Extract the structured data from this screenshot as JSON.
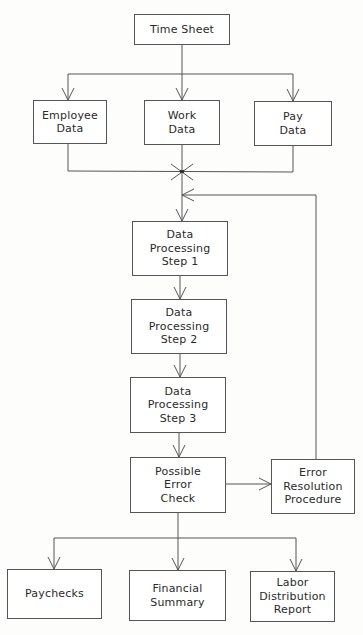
{
  "diagram": {
    "type": "flowchart",
    "nodes": [
      {
        "id": "time-sheet",
        "label": "Time Sheet"
      },
      {
        "id": "employee-data",
        "label": "Employee\nData"
      },
      {
        "id": "work-data",
        "label": "Work\nData"
      },
      {
        "id": "pay-data",
        "label": "Pay\nData"
      },
      {
        "id": "dp-step-1",
        "label": "Data\nProcessing\nStep 1"
      },
      {
        "id": "dp-step-2",
        "label": "Data\nProcessing\nStep 2"
      },
      {
        "id": "dp-step-3",
        "label": "Data\nProcessing\nStep 3"
      },
      {
        "id": "error-check",
        "label": "Possible\nError\nCheck"
      },
      {
        "id": "error-resolution",
        "label": "Error\nResolution\nProcedure"
      },
      {
        "id": "paychecks",
        "label": "Paychecks"
      },
      {
        "id": "financial-summary",
        "label": "Financial\nSummary"
      },
      {
        "id": "labor-report",
        "label": "Labor\nDistribution\nReport"
      }
    ],
    "edges": [
      {
        "from": "time-sheet",
        "to": "employee-data"
      },
      {
        "from": "time-sheet",
        "to": "work-data"
      },
      {
        "from": "time-sheet",
        "to": "pay-data"
      },
      {
        "from": "employee-data",
        "to": "dp-step-1"
      },
      {
        "from": "work-data",
        "to": "dp-step-1"
      },
      {
        "from": "pay-data",
        "to": "dp-step-1"
      },
      {
        "from": "dp-step-1",
        "to": "dp-step-2"
      },
      {
        "from": "dp-step-2",
        "to": "dp-step-3"
      },
      {
        "from": "dp-step-3",
        "to": "error-check"
      },
      {
        "from": "error-check",
        "to": "error-resolution"
      },
      {
        "from": "error-resolution",
        "to": "dp-step-1"
      },
      {
        "from": "error-check",
        "to": "paychecks"
      },
      {
        "from": "error-check",
        "to": "financial-summary"
      },
      {
        "from": "error-check",
        "to": "labor-report"
      }
    ]
  }
}
